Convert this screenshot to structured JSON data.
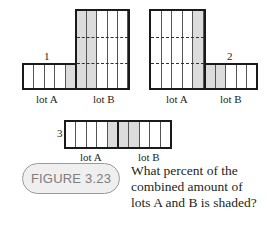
{
  "figure": {
    "label": "FIGURE 3.23",
    "caption_lines": [
      "What percent of the",
      "combined amount of",
      "lots A and B is shaded?"
    ]
  },
  "diagrams": [
    {
      "number": "1",
      "lot_a": {
        "label": "lot A",
        "columns": 5,
        "shaded_columns": [
          5
        ],
        "height_units": 1
      },
      "lot_b": {
        "label": "lot B",
        "columns": 5,
        "shaded_columns": [
          1,
          2
        ],
        "height_units": 3
      }
    },
    {
      "number": "2",
      "lot_a": {
        "label": "lot A",
        "columns": 5,
        "shaded_columns": [
          5
        ],
        "height_units": 3
      },
      "lot_b": {
        "label": "lot B",
        "columns": 5,
        "shaded_columns": [
          1,
          2
        ],
        "height_units": 1
      }
    },
    {
      "number": "3",
      "lot_a": {
        "label": "lot A",
        "columns": 5,
        "shaded_columns": [
          5
        ],
        "height_units": 1
      },
      "lot_b": {
        "label": "lot B",
        "columns": 5,
        "shaded_columns": [
          1,
          2
        ],
        "height_units": 1
      }
    }
  ],
  "colors": {
    "shade": "#dcdcdc",
    "outline": "#1a1a1a",
    "badge_fill": "#efefef",
    "badge_text": "#7d7d7d"
  }
}
